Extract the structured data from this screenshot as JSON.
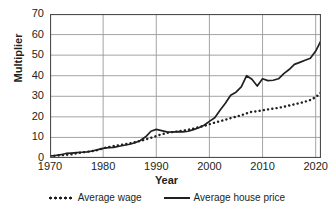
{
  "chart_data": {
    "type": "line",
    "title": "",
    "xlabel": "Year",
    "ylabel": "Multiplier",
    "xlim": [
      1970,
      2021
    ],
    "ylim": [
      0,
      70
    ],
    "grid": true,
    "legend_position": "bottom",
    "xticks": [
      1970,
      1980,
      1990,
      2000,
      2010,
      2020
    ],
    "yticks": [
      0,
      10,
      20,
      30,
      40,
      50,
      60,
      70
    ],
    "x": [
      1970,
      1971,
      1972,
      1973,
      1974,
      1975,
      1976,
      1977,
      1978,
      1979,
      1980,
      1981,
      1982,
      1983,
      1984,
      1985,
      1986,
      1987,
      1988,
      1989,
      1990,
      1991,
      1992,
      1993,
      1994,
      1995,
      1996,
      1997,
      1998,
      1999,
      2000,
      2001,
      2002,
      2003,
      2004,
      2005,
      2006,
      2007,
      2008,
      2009,
      2010,
      2011,
      2012,
      2013,
      2014,
      2015,
      2016,
      2017,
      2018,
      2019,
      2020,
      2021
    ],
    "series": [
      {
        "name": "Average wage",
        "style": "dotted",
        "color": "#231f20",
        "values": [
          1.0,
          1.1,
          1.3,
          1.5,
          1.8,
          2.3,
          2.7,
          3.0,
          3.4,
          3.9,
          4.7,
          5.3,
          5.8,
          6.2,
          6.6,
          7.1,
          7.7,
          8.3,
          9.0,
          9.8,
          10.7,
          11.5,
          12.2,
          12.6,
          12.9,
          13.3,
          13.7,
          14.3,
          15.0,
          15.6,
          16.4,
          17.2,
          17.9,
          18.6,
          19.4,
          20.1,
          20.8,
          21.7,
          22.5,
          22.7,
          23.2,
          23.6,
          24.0,
          24.4,
          24.9,
          25.5,
          26.1,
          26.7,
          27.4,
          28.2,
          29.6,
          31.8
        ]
      },
      {
        "name": "Average house price",
        "style": "solid",
        "color": "#231f20",
        "values": [
          1.0,
          1.2,
          1.6,
          2.2,
          2.4,
          2.6,
          2.8,
          3.0,
          3.4,
          4.1,
          4.7,
          5.0,
          5.2,
          5.7,
          6.2,
          6.7,
          7.4,
          8.5,
          10.3,
          13.0,
          13.9,
          13.3,
          12.7,
          12.6,
          12.8,
          12.7,
          13.0,
          13.8,
          14.7,
          15.9,
          17.8,
          19.6,
          23.2,
          26.6,
          30.5,
          32.0,
          34.6,
          40.0,
          38.3,
          35.0,
          38.5,
          37.6,
          37.8,
          38.5,
          41.0,
          43.0,
          45.5,
          46.5,
          47.5,
          48.5,
          52.0,
          57.0
        ]
      }
    ],
    "annotations": {
      "peak_1990": 13.9,
      "peak_2007": 40.0,
      "trough_2009": 35.0,
      "end_house_price": 64,
      "end_wage": 31.8
    }
  },
  "axes": {
    "ylabel": "Multiplier",
    "xlabel": "Year",
    "yticks": [
      "70",
      "60",
      "50",
      "40",
      "30",
      "20",
      "10",
      "0"
    ],
    "xticks": [
      "1970",
      "1980",
      "1990",
      "2000",
      "2010",
      "2020"
    ]
  },
  "legend": {
    "items": [
      {
        "label": "Average wage",
        "marker": "dotted-line-marker"
      },
      {
        "label": "Average house price",
        "marker": "solid-line-marker"
      }
    ]
  },
  "colors": {
    "ink": "#231f20",
    "grid": "#9a9a9a",
    "axis": "#4d4d4d",
    "background": "#ffffff"
  }
}
